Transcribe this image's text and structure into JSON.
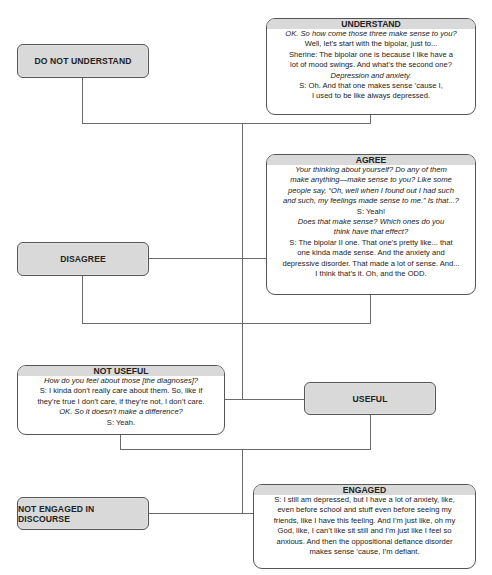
{
  "diagram": {
    "nodes": {
      "do_not_understand": {
        "label": "DO NOT UNDERSTAND"
      },
      "understand": {
        "title": "UNDERSTAND",
        "lines": [
          {
            "text": "OK. So how come those three make sense to you?",
            "italic": true
          },
          {
            "text": "Well, let’s start with the bipolar, just to...",
            "italic": false
          },
          {
            "text": "Sherine: The bipolar one is because I like have a",
            "italic": false
          },
          {
            "text": "lot of mood swings. And what’s the second one?",
            "italic": false
          },
          {
            "text": "Depression and anxiety.",
            "italic": true
          },
          {
            "text": "S: Oh. And that one makes sense ’cause I,",
            "italic": false
          },
          {
            "text": "I used to be like always depressed.",
            "italic": false
          }
        ]
      },
      "agree": {
        "title": "AGREE",
        "lines": [
          {
            "text": "Your thinking about yourself? Do any of them",
            "italic": true
          },
          {
            "text": "make anything—make sense to you? Like some",
            "italic": true
          },
          {
            "text": "people say, “Oh, well when I found out I had such",
            "italic": true
          },
          {
            "text": "and such, my feelings made sense to me.” Is that...?",
            "italic": true
          },
          {
            "text": "S: Yeah!",
            "italic": false
          },
          {
            "text": "Does that make sense? Which ones do you",
            "italic": true
          },
          {
            "text": "think have that effect?",
            "italic": true
          },
          {
            "text": "S: The bipolar II one. That one’s pretty like... that",
            "italic": false
          },
          {
            "text": "one kinda made sense. And the anxiety and",
            "italic": false
          },
          {
            "text": "depressive disorder. That made a lot of sense. And...",
            "italic": false
          },
          {
            "text": "I think that’s it. Oh, and the ODD.",
            "italic": false
          }
        ]
      },
      "disagree": {
        "label": "DISAGREE"
      },
      "not_useful": {
        "title": "NOT USEFUL",
        "lines": [
          {
            "text": "How do you feel about those [the diagnoses]?",
            "italic": true
          },
          {
            "text": "S: I kinda don’t really care about them. So, like if",
            "italic": false
          },
          {
            "text": "they’re true I don’t care, if they’re not, I don’t care.",
            "italic": false
          },
          {
            "text": "OK. So it doesn’t make a difference?",
            "italic": true
          },
          {
            "text": "S: Yeah.",
            "italic": false
          }
        ]
      },
      "useful": {
        "label": "USEFUL"
      },
      "not_engaged": {
        "label": "NOT ENGAGED IN DISCOURSE"
      },
      "engaged": {
        "title": "ENGAGED",
        "lines": [
          {
            "text": "S: I still am depressed, but I have a lot of anxiety, like,",
            "italic": false
          },
          {
            "text": "even before school and stuff even before seeing my",
            "italic": false
          },
          {
            "text": "friends,  like I have this feeling. And I’m just like, oh my",
            "italic": false
          },
          {
            "text": "God, like, I can’t like sit still and I’m just like I feel so",
            "italic": false
          },
          {
            "text": "anxious. And then the oppositional defiance disorder",
            "italic": false
          },
          {
            "text": "makes sense ’cause, I’m defiant.",
            "italic": false
          }
        ]
      }
    }
  }
}
